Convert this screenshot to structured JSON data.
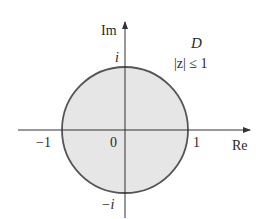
{
  "diagram": {
    "region": {
      "name": "D",
      "condition": "|z| ≤ 1",
      "fill": "#e6e6e6",
      "stroke": "#555555"
    },
    "axes": {
      "x_label": "Re",
      "y_label": "Im",
      "color": "#333333"
    },
    "tick_labels": {
      "origin": "0",
      "re_pos": "1",
      "re_neg": "−1",
      "im_pos": "i",
      "im_neg": "−i"
    }
  }
}
